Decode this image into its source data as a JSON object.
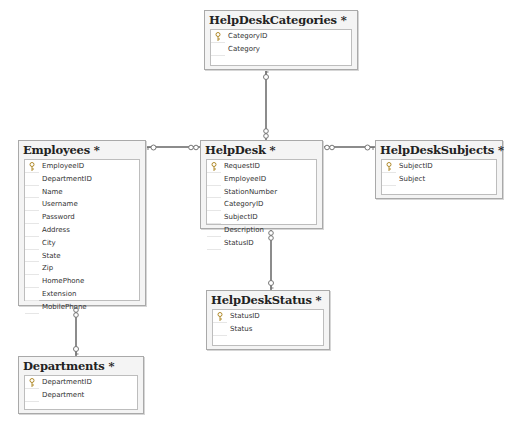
{
  "diagram": {
    "tables": [
      {
        "id": "helpdeskcategories",
        "title": "HelpDeskCategories *",
        "columns": [
          {
            "name": "CategoryID",
            "primary_key": true
          },
          {
            "name": "Category",
            "primary_key": false
          }
        ]
      },
      {
        "id": "employees",
        "title": "Employees *",
        "columns": [
          {
            "name": "EmployeeID",
            "primary_key": true
          },
          {
            "name": "DepartmentID",
            "primary_key": false
          },
          {
            "name": "Name",
            "primary_key": false
          },
          {
            "name": "Username",
            "primary_key": false
          },
          {
            "name": "Password",
            "primary_key": false
          },
          {
            "name": "Address",
            "primary_key": false
          },
          {
            "name": "City",
            "primary_key": false
          },
          {
            "name": "State",
            "primary_key": false
          },
          {
            "name": "Zip",
            "primary_key": false
          },
          {
            "name": "HomePhone",
            "primary_key": false
          },
          {
            "name": "Extension",
            "primary_key": false
          },
          {
            "name": "MobilePhone",
            "primary_key": false
          }
        ]
      },
      {
        "id": "helpdesk",
        "title": "HelpDesk *",
        "columns": [
          {
            "name": "RequestID",
            "primary_key": true
          },
          {
            "name": "EmployeeID",
            "primary_key": false
          },
          {
            "name": "StationNumber",
            "primary_key": false
          },
          {
            "name": "CategoryID",
            "primary_key": false
          },
          {
            "name": "SubjectID",
            "primary_key": false
          },
          {
            "name": "Description",
            "primary_key": false
          },
          {
            "name": "StatusID",
            "primary_key": false
          }
        ]
      },
      {
        "id": "helpdesksubjects",
        "title": "HelpDeskSubjects *",
        "columns": [
          {
            "name": "SubjectID",
            "primary_key": true
          },
          {
            "name": "Subject",
            "primary_key": false
          }
        ]
      },
      {
        "id": "helpdeskstatus",
        "title": "HelpDeskStatus *",
        "columns": [
          {
            "name": "StatusID",
            "primary_key": true
          },
          {
            "name": "Status",
            "primary_key": false
          }
        ]
      },
      {
        "id": "departments",
        "title": "Departments *",
        "columns": [
          {
            "name": "DepartmentID",
            "primary_key": true
          },
          {
            "name": "Department",
            "primary_key": false
          }
        ]
      }
    ],
    "relationships": [
      {
        "from": "Employees",
        "to": "HelpDesk",
        "one_end": "Employees",
        "many_end": "HelpDesk"
      },
      {
        "from": "HelpDeskCategories",
        "to": "HelpDesk",
        "one_end": "HelpDeskCategories",
        "many_end": "HelpDesk"
      },
      {
        "from": "HelpDeskSubjects",
        "to": "HelpDesk",
        "one_end": "HelpDeskSubjects",
        "many_end": "HelpDesk"
      },
      {
        "from": "HelpDeskStatus",
        "to": "HelpDesk",
        "one_end": "HelpDeskStatus",
        "many_end": "HelpDesk"
      },
      {
        "from": "Departments",
        "to": "Employees",
        "one_end": "Departments",
        "many_end": "Employees"
      }
    ],
    "icons": {
      "primary_key": "key-icon",
      "one_end": "key-icon",
      "many_end": "infinity-icon"
    },
    "colors": {
      "background": "#ffffff",
      "table_header": "#f4f4f4",
      "table_border": "#a9a9a9",
      "connector": "#8c8c8c"
    }
  }
}
